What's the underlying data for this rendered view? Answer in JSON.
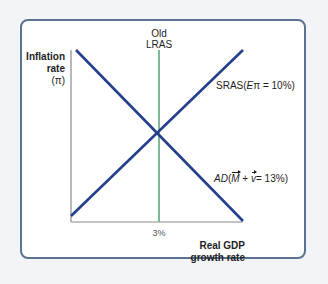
{
  "diagram": {
    "title_top": {
      "line1": "Old",
      "line2": "LRAS"
    },
    "y_axis": {
      "line1": "Inflation",
      "line2": "rate",
      "line3": "(π)"
    },
    "x_axis": {
      "line1": "Real GDP",
      "line2": "growth rate",
      "tick": "3%"
    },
    "curves": {
      "sras": {
        "prefix": "SRAS(",
        "e": "E",
        "pi": "π",
        "rest": " = 10%)"
      },
      "ad": {
        "prefix": "AD",
        "open": "(",
        "m": "M",
        "plus": " + ",
        "v": "v",
        "rest": "= 13%)"
      },
      "lras": {
        "name": "Old LRAS",
        "value": "3%"
      }
    },
    "colors": {
      "frame": "#5b7391",
      "curve": "#263f8c",
      "lras": "#7fb894",
      "axis": "#8a8a8a"
    }
  }
}
